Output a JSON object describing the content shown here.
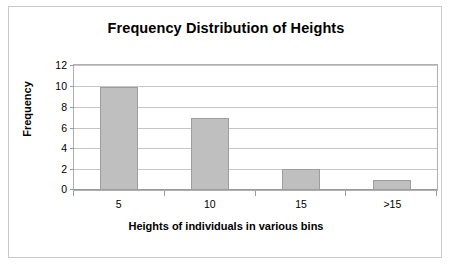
{
  "chart_data": {
    "type": "bar",
    "title": "Frequency Distribution of Heights",
    "xlabel": "Heights of individuals in various bins",
    "ylabel": "Frequency",
    "categories": [
      "5",
      "10",
      "15",
      ">15"
    ],
    "values": [
      10,
      7,
      2,
      1
    ],
    "ylim": [
      0,
      12
    ],
    "ytick_step": 2,
    "yticks": [
      "0",
      "2",
      "4",
      "6",
      "8",
      "10",
      "12"
    ],
    "grid": "horizontal",
    "legend": "none",
    "series": [
      {
        "name": "Frequency",
        "values": [
          10,
          7,
          2,
          1
        ]
      }
    ],
    "colors": {
      "bar_fill": "#bfbfbf",
      "bar_border": "#9d9d9d",
      "gridline": "#c6c6c6",
      "axis": "#9a9a9a",
      "plot_border": "#b0b0b0",
      "frame_border": "#c9c9c9",
      "text": "#000000",
      "background": "#ffffff"
    }
  }
}
